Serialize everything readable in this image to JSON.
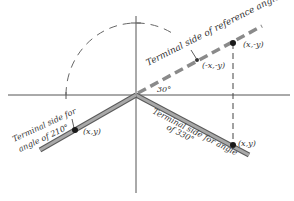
{
  "diagram": {
    "labels": {
      "reference_side": "Terminal side of reference angle",
      "point_neg_x_neg_y": "(-x,-y)",
      "point_x_neg_y": "(x,-y)",
      "angle_30": "30°",
      "terminal_210_line1": "Terminal side for",
      "terminal_210_line2": "angle of 210°",
      "point_210": "(x,y)",
      "terminal_330_line1": "Terminal side for angle",
      "terminal_330_line2": "of 330°",
      "point_330": "(x,y)"
    },
    "colors": {
      "axis": "#555555",
      "terminal_side": "#8f8f8f",
      "terminal_outline": "#5a5a5a",
      "reference_dash": "#888888",
      "point": "#1a1a1a",
      "text": "#333333"
    }
  }
}
